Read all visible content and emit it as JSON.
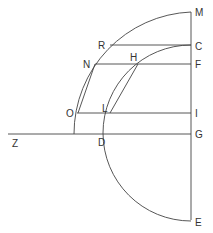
{
  "diagram": {
    "labels": {
      "M": "M",
      "R": "R",
      "C": "C",
      "N": "N",
      "H": "H",
      "F": "F",
      "O": "O",
      "L": "L",
      "I": "I",
      "Z": "Z",
      "D": "D",
      "G": "G",
      "E": "E"
    },
    "stroke_color": "#444444"
  }
}
